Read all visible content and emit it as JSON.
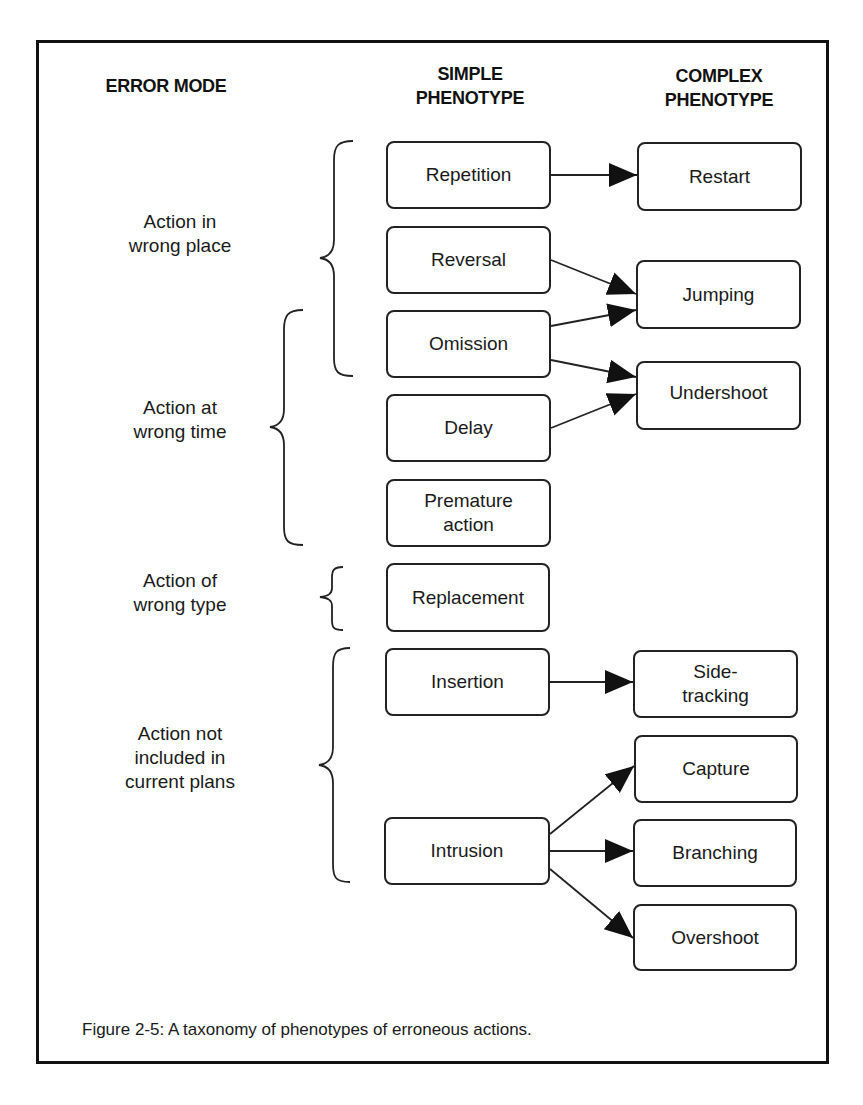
{
  "headers": {
    "error_mode": "ERROR MODE",
    "simple_phenotype_1": "SIMPLE",
    "simple_phenotype_2": "PHENOTYPE",
    "complex_phenotype_1": "COMPLEX",
    "complex_phenotype_2": "PHENOTYPE"
  },
  "error_modes": [
    {
      "label_1": "Action in",
      "label_2": "wrong place"
    },
    {
      "label_1": "Action at",
      "label_2": "wrong time"
    },
    {
      "label_1": "Action of",
      "label_2": "wrong type"
    },
    {
      "label_1": "Action not",
      "label_2": "included in",
      "label_3": "current plans"
    }
  ],
  "simple_phenotypes": [
    {
      "label": "Repetition"
    },
    {
      "label": "Reversal"
    },
    {
      "label": "Omission"
    },
    {
      "label": "Delay"
    },
    {
      "label_1": "Premature",
      "label_2": "action"
    },
    {
      "label": "Replacement"
    },
    {
      "label": "Insertion"
    },
    {
      "label": "Intrusion"
    }
  ],
  "complex_phenotypes": [
    {
      "label": "Restart"
    },
    {
      "label": "Jumping"
    },
    {
      "label": "Undershoot"
    },
    {
      "label_1": "Side-",
      "label_2": "tracking"
    },
    {
      "label": "Capture"
    },
    {
      "label": "Branching"
    },
    {
      "label": "Overshoot"
    }
  ],
  "edges": [
    {
      "from": "Repetition",
      "to": "Restart"
    },
    {
      "from": "Reversal",
      "to": "Jumping"
    },
    {
      "from": "Omission",
      "to": "Jumping"
    },
    {
      "from": "Omission",
      "to": "Undershoot"
    },
    {
      "from": "Delay",
      "to": "Undershoot"
    },
    {
      "from": "Insertion",
      "to": "Side-tracking"
    },
    {
      "from": "Intrusion",
      "to": "Capture"
    },
    {
      "from": "Intrusion",
      "to": "Branching"
    },
    {
      "from": "Intrusion",
      "to": "Overshoot"
    }
  ],
  "caption": "Figure 2-5: A taxonomy of phenotypes of erroneous actions."
}
